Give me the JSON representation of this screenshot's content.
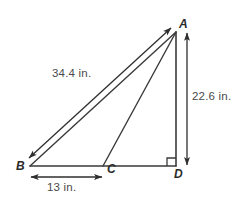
{
  "figure": {
    "type": "geometry-diagram",
    "stroke_color": "#333333",
    "text_color": "#3a3a3a",
    "background_color": "#ffffff",
    "vertices": [
      {
        "name": "A",
        "label": "A",
        "x": 176,
        "y": 32
      },
      {
        "name": "B",
        "label": "B",
        "x": 30,
        "y": 166
      },
      {
        "name": "C",
        "label": "C",
        "x": 103,
        "y": 166
      },
      {
        "name": "D",
        "label": "D",
        "x": 176,
        "y": 166
      }
    ],
    "segments": [
      {
        "name": "side-AB",
        "from": "A",
        "to": "B"
      },
      {
        "name": "side-BD",
        "from": "B",
        "to": "D"
      },
      {
        "name": "side-AD",
        "from": "A",
        "to": "D"
      },
      {
        "name": "cevian-AC",
        "from": "A",
        "to": "C"
      }
    ],
    "right_angle": {
      "at": "D",
      "size": 8
    },
    "dimensions": [
      {
        "name": "dimension-AB",
        "label": "34.4 in.",
        "value": 34.4,
        "unit": "in.",
        "measures": "AB",
        "orientation": "diagonal"
      },
      {
        "name": "dimension-AD",
        "label": "22.6 in.",
        "value": 22.6,
        "unit": "in.",
        "measures": "AD",
        "orientation": "vertical"
      },
      {
        "name": "dimension-BC",
        "label": "13 in.",
        "value": 13,
        "unit": "in.",
        "measures": "BC",
        "orientation": "horizontal"
      }
    ]
  }
}
